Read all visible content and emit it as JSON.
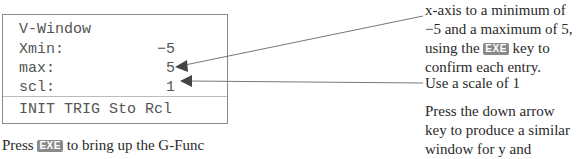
{
  "screen": {
    "title": "V-Window",
    "rows": [
      {
        "label": "Xmin:",
        "value": "−5"
      },
      {
        "label": "max:",
        "value": "5"
      },
      {
        "label": "scl:",
        "value": "1"
      }
    ],
    "softkeys": "INIT TRIG Sto Rcl"
  },
  "bottom_caption": {
    "pre": "Press",
    "key": "EXE",
    "post": "to bring up the G-Func"
  },
  "annotations": {
    "block1": {
      "line1": "x-axis to a minimum of",
      "line2": "−5 and a maximum of 5,",
      "line3_pre": "using the",
      "line3_key": "EXE",
      "line3_post": "key to",
      "line4": "confirm each entry."
    },
    "block2": "Use a scale of 1",
    "block3": {
      "line1": "Press the down arrow",
      "line2": "key to produce a similar",
      "line3": "window for y and change",
      "line4": "the y-axis from −5 to 5,"
    }
  },
  "colors": {
    "key_bg": "#8a8a8a",
    "border": "#8a8a8a",
    "arrow": "#444444"
  }
}
